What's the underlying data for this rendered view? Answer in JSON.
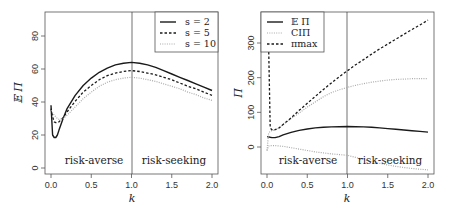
{
  "chart_data": [
    {
      "type": "line",
      "panel": "left",
      "title": "",
      "xlabel": "k",
      "ylabel": "E Π",
      "xlim": [
        0,
        2
      ],
      "ylim": [
        0,
        90
      ],
      "xticks": [
        "0.0",
        "0.5",
        "1.0",
        "1.5",
        "2.0"
      ],
      "yticks": [
        "0",
        "20",
        "40",
        "60",
        "80"
      ],
      "grid": false,
      "legend_position": "top-right",
      "vertical_line_at": 1.0,
      "annotations": [
        "risk-averse",
        "risk-seeking"
      ],
      "x": [
        0.0,
        0.02,
        0.04,
        0.06,
        0.08,
        0.1,
        0.15,
        0.2,
        0.3,
        0.4,
        0.5,
        0.6,
        0.7,
        0.8,
        0.9,
        1.0,
        1.1,
        1.2,
        1.3,
        1.4,
        1.5,
        1.6,
        1.7,
        1.8,
        1.9,
        2.0
      ],
      "series": [
        {
          "name": "s = 2",
          "style": "solid",
          "values": [
            38,
            20,
            18.5,
            18.5,
            20,
            23,
            30,
            36,
            44,
            50,
            54.5,
            58,
            60.5,
            62.5,
            63.5,
            64,
            63.5,
            62.5,
            61,
            59,
            57,
            55,
            53,
            51,
            49,
            47
          ]
        },
        {
          "name": "s = 5",
          "style": "dashed",
          "values": [
            36,
            31,
            28,
            27.5,
            27.5,
            28,
            30.5,
            34,
            40.5,
            46,
            50,
            53.5,
            56,
            57.5,
            58.5,
            59,
            58.5,
            57.5,
            56.5,
            55,
            53.5,
            51.5,
            49.5,
            48,
            46,
            44
          ]
        },
        {
          "name": "s = 10",
          "style": "dotted",
          "values": [
            35,
            33.5,
            32,
            31,
            30,
            29.5,
            30,
            32,
            37,
            42,
            46,
            49.5,
            52,
            53.5,
            54.5,
            55,
            54.5,
            53.5,
            52.5,
            51,
            49.5,
            48,
            46,
            44.5,
            42.5,
            41
          ]
        }
      ]
    },
    {
      "type": "line",
      "panel": "right",
      "title": "",
      "xlabel": "k",
      "ylabel": "Π",
      "xlim": [
        0,
        2
      ],
      "ylim": [
        -75,
        380
      ],
      "xticks": [
        "0.0",
        "0.5",
        "1.0",
        "1.5",
        "2.0"
      ],
      "yticks": [
        "0",
        "100",
        "200",
        "300"
      ],
      "grid": false,
      "legend_position": "top-left",
      "vertical_line_at": 1.0,
      "annotations": [
        "risk-averse",
        "risk-seeking"
      ],
      "x": [
        0.0,
        0.02,
        0.04,
        0.06,
        0.08,
        0.1,
        0.15,
        0.2,
        0.3,
        0.4,
        0.5,
        0.6,
        0.7,
        0.8,
        0.9,
        1.0,
        1.1,
        1.2,
        1.3,
        1.4,
        1.5,
        1.6,
        1.7,
        1.8,
        1.9,
        2.0
      ],
      "series": [
        {
          "name": "E Π",
          "style": "solid",
          "values": [
            30,
            29,
            28,
            27,
            27,
            27,
            30,
            35,
            42,
            48,
            52,
            55,
            57,
            58,
            58.5,
            59,
            58.5,
            58,
            57,
            55,
            53,
            51,
            49,
            47,
            45,
            43
          ]
        },
        {
          "name": "CIΠ",
          "style": "dotted-upper",
          "values": [
            -10,
            40,
            45,
            47,
            48,
            49,
            55,
            65,
            82,
            98,
            115,
            130,
            145,
            157,
            165,
            172,
            178,
            183,
            187,
            190,
            193,
            195,
            196,
            197,
            197,
            197
          ]
        },
        {
          "name": "CIΠ lower",
          "style": "dotted-lower",
          "values": [
            -10,
            3,
            4,
            4,
            4,
            4,
            3,
            2,
            -2,
            -6,
            -10,
            -14,
            -17,
            -20,
            -22,
            -24,
            -30,
            -36,
            -42,
            -47,
            -52,
            -56,
            -59,
            -62,
            -64,
            -66
          ]
        },
        {
          "name": "π_max",
          "style": "dashed",
          "values": [
            295,
            295,
            55,
            50,
            48,
            50,
            55,
            65,
            84,
            106,
            126,
            146,
            166,
            185,
            203,
            220,
            237,
            252,
            268,
            283,
            297,
            311,
            325,
            339,
            352,
            366
          ]
        }
      ]
    }
  ],
  "left": {
    "ylabel": "𝔼 Π",
    "xlabel": "k",
    "yticks": [
      "0",
      "20",
      "40",
      "60",
      "80"
    ],
    "xticks": [
      "0.0",
      "0.5",
      "1.0",
      "1.5",
      "2.0"
    ],
    "region_left": "risk-averse",
    "region_right": "risk-seeking",
    "legend": [
      "s = 2",
      "s = 5",
      "s = 10"
    ]
  },
  "right": {
    "ylabel": "Π",
    "xlabel": "k",
    "yticks": [
      "0",
      "100",
      "200",
      "300"
    ],
    "xticks": [
      "0.0",
      "0.5",
      "1.0",
      "1.5",
      "2.0"
    ],
    "region_left": "risk-averse",
    "region_right": "risk-seeking",
    "legend": [
      "𝔼 Π",
      "CIΠ",
      "πmax"
    ]
  },
  "colors": {
    "solid": "#1a1a1a",
    "dashed": "#1a1a1a",
    "dotted": "#aaaaaa",
    "axis": "#555555"
  }
}
